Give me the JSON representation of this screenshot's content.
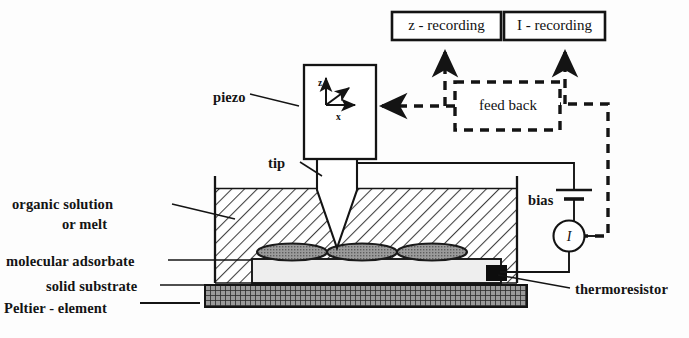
{
  "diagram": {
    "colors": {
      "ink": "#141414",
      "liquid_hatch": "#4a4a4a",
      "adsorbate_fill": "#8f8f8f",
      "substrate_fill": "#ededed",
      "peltier_fill": "#6e6e6e",
      "thermoresistor_fill": "#101010",
      "background": "#fdfdfd"
    },
    "boxes": {
      "z_recording": "z - recording",
      "i_recording": "I - recording",
      "feed_back": "feed back",
      "piezo_axes": {
        "z": "z",
        "y": "y",
        "x": "x"
      }
    },
    "labels": {
      "piezo": "piezo",
      "tip": "tip",
      "organic_solution_line1": "organic solution",
      "organic_solution_line2": "or melt",
      "molecular_adsorbate": "molecular adsorbate",
      "solid_substrate": "solid substrate",
      "peltier_element": "Peltier - element",
      "thermoresistor": "thermoresistor",
      "bias": "bias",
      "current_meter": "I"
    }
  }
}
